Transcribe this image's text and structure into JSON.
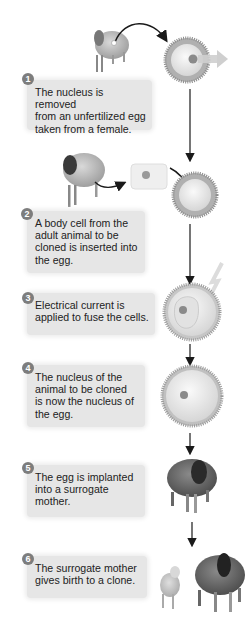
{
  "diagram": {
    "type": "process-flow",
    "steps": [
      {
        "number": "1",
        "text": "The nucleus is removed\nfrom an unfertilized egg\ntaken from a female."
      },
      {
        "number": "2",
        "text": "A body cell from the\nadult animal to be\ncloned is inserted into\nthe egg."
      },
      {
        "number": "3",
        "text": "Electrical current is\napplied to fuse the cells."
      },
      {
        "number": "4",
        "text": "The nucleus of the\nanimal to be cloned\nis now the nucleus of\nthe egg."
      },
      {
        "number": "5",
        "text": "The egg is implanted\ninto a surrogate\nmother."
      },
      {
        "number": "6",
        "text": "The surrogate mother\ngives birth to a clone."
      }
    ],
    "illustrations": [
      "female-sheep-icon",
      "unfertilized-egg-icon",
      "nucleus-removal-arrow-icon",
      "adult-sheep-icon",
      "body-cell-icon",
      "enucleated-egg-icon",
      "lightning-bolt-icon",
      "fused-cell-icon",
      "egg-with-new-nucleus-icon",
      "surrogate-sheep-icon",
      "lamb-clone-icon"
    ],
    "colors": {
      "box_bg": "#e6e6e6",
      "badge": "#7d7d7d",
      "arrow": "#1a1a1a",
      "egg_rim": "#a8a8a8",
      "egg_fill": "#ededed"
    }
  }
}
